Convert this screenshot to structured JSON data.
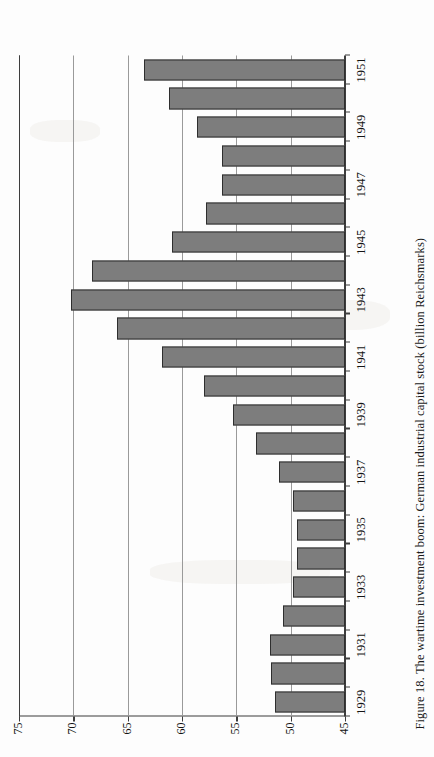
{
  "figure": {
    "caption": "Figure 18. The wartime investment boom: German industrial capital stock (billion Reichsmarks)"
  },
  "chart_data": {
    "type": "bar",
    "orientation": "horizontal",
    "title": "Figure 18. The wartime investment boom: German industrial capital stock (billion Reichsmarks)",
    "xlabel": "",
    "ylabel": "",
    "value_unit": "billion Reichsmarks",
    "xlim": [
      45,
      75
    ],
    "value_ticks": [
      45,
      50,
      55,
      60,
      65,
      70,
      75
    ],
    "value_tick_labels": [
      "45",
      "50",
      "55",
      "60",
      "65",
      "70",
      "75"
    ],
    "grid": true,
    "legend": false,
    "bar_color": "#7d7d7d",
    "bar_edge_color": "#2e2e2e",
    "categories": [
      "1929",
      "1930",
      "1931",
      "1932",
      "1933",
      "1934",
      "1935",
      "1936",
      "1937",
      "1938",
      "1939",
      "1940",
      "1941",
      "1942",
      "1943",
      "1944",
      "1945",
      "1946",
      "1947",
      "1948",
      "1949",
      "1950",
      "1951"
    ],
    "category_labels_shown": [
      "1929",
      "1931",
      "1933",
      "1935",
      "1937",
      "1939",
      "1941",
      "1943",
      "1945",
      "1947",
      "1949",
      "1951"
    ],
    "values": [
      51.4,
      51.8,
      51.9,
      50.7,
      49.8,
      49.4,
      49.4,
      49.8,
      51.1,
      53.2,
      55.3,
      58.0,
      61.8,
      66.0,
      70.2,
      68.3,
      60.9,
      57.8,
      56.3,
      56.3,
      58.6,
      61.2,
      63.5
    ]
  }
}
